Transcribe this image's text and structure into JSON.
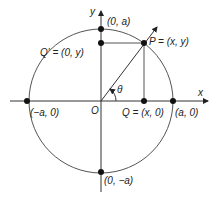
{
  "diagram": {
    "axes": {
      "x_label": "x",
      "y_label": "y",
      "origin_label": "O"
    },
    "angle_label": "θ",
    "points": [
      {
        "id": "top",
        "label": "(0, a)"
      },
      {
        "id": "P",
        "label": "P = (x, y)"
      },
      {
        "id": "Qprime",
        "label": "Q′ = (0, y)"
      },
      {
        "id": "left",
        "label": "(−a, 0)"
      },
      {
        "id": "Q",
        "label": "Q = (x, 0)"
      },
      {
        "id": "right",
        "label": "(a, 0)"
      },
      {
        "id": "bottom",
        "label": "(0, −a)"
      }
    ],
    "colors": {
      "stroke": "#333333",
      "circle": "#555555",
      "dot": "#111111"
    }
  }
}
